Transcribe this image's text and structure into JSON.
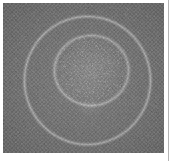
{
  "document": {
    "background_color": "#ffffff",
    "gutter_rule_color": "#b4b4b4",
    "gutter_rule_x": 168
  },
  "figure": {
    "name": "grayscale-concentric-ring-micrograph",
    "panel": {
      "x": 3,
      "y": 3,
      "width": 161,
      "height": 150
    },
    "render": {
      "type": "raster-procedural",
      "colorspace": "grayscale",
      "background_level": 124,
      "vignette_corner_level": 104,
      "dither": {
        "pattern": "checkerboard",
        "cell_px": 2,
        "amplitude": 13
      },
      "noise": {
        "grain_amplitude": 11,
        "speckle_amplitude": 26,
        "seed": 20240917
      }
    },
    "rings": [
      {
        "name": "outer-ring",
        "cx": 84,
        "cy": 77,
        "rx": 63,
        "ry": 64,
        "stroke_width": 1.6,
        "brightness_gain": 52,
        "edge_softness": 2.2
      },
      {
        "name": "inner-ring",
        "cx": 88,
        "cy": 67,
        "rx": 37,
        "ry": 35,
        "stroke_width": 1.8,
        "brightness_gain": 46,
        "edge_softness": 2.4
      }
    ],
    "core": {
      "name": "bright-speckled-core",
      "cx": 88,
      "cy": 67,
      "radius": 36,
      "brightness_gain": 14,
      "speckle_density": 0.34,
      "speckle_gain": 30
    },
    "tail": {
      "name": "lower-wisp",
      "cx": 86,
      "cy": 104,
      "radius": 16,
      "brightness_gain": 16
    }
  },
  "colors": {
    "page_background": "#ffffff",
    "field_mid_gray": "#7c7c7c",
    "field_dark_gray": "#686868",
    "ring_highlight": "#c8c8c8",
    "rule_gray": "#b4b4b4"
  }
}
